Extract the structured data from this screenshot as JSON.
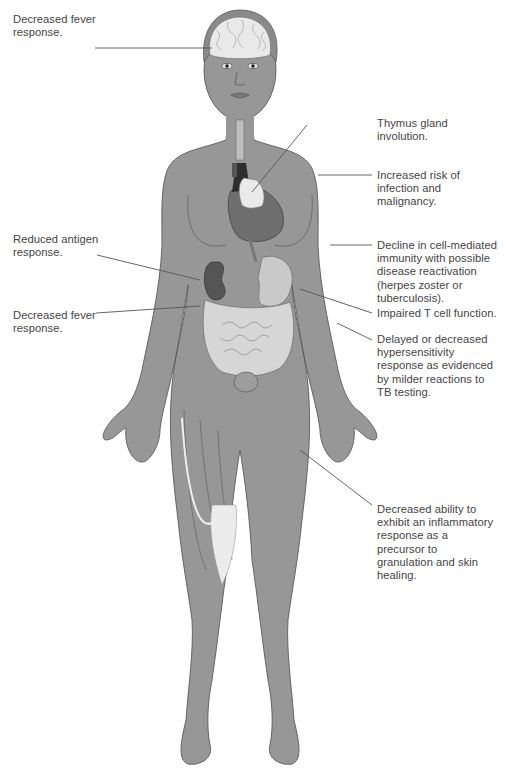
{
  "figure": {
    "colors": {
      "skin": "#979797",
      "outline": "#5a5a5a",
      "brain": "#e9e9e9",
      "hair": "#8a8a8a",
      "heart": "#6e6e6e",
      "kidney": "#555555",
      "organs_light": "#c9c9c9",
      "intestines": "#d6d6d6",
      "tendon": "#ececec",
      "muscle": "#8c8c8c",
      "leader_line": "#555555",
      "text": "#444444"
    }
  },
  "labels": {
    "left": [
      {
        "id": "decreased-fever-head",
        "text": "Decreased fever\nresponse."
      },
      {
        "id": "reduced-antigen",
        "text": "Reduced antigen\nresponse."
      },
      {
        "id": "decreased-fever-abdomen",
        "text": "Decreased fever\nresponse."
      }
    ],
    "right": [
      {
        "id": "thymus",
        "text": "Thymus gland\ninvolution."
      },
      {
        "id": "infection-risk",
        "text": "Increased risk of\ninfection and\nmalignancy."
      },
      {
        "id": "cell-mediated",
        "text": "Decline in cell-mediated\nimmunity with possible\ndisease reactivation\n(herpes zoster or\ntuberculosis)."
      },
      {
        "id": "t-cell",
        "text": "Impaired T cell function."
      },
      {
        "id": "hypersensitivity",
        "text": "Delayed or decreased\nhypersensitivity\nresponse as evidenced\nby milder reactions to\nTB testing."
      },
      {
        "id": "inflammatory",
        "text": "Decreased ability to\nexhibit an inflammatory\nresponse as a\nprecursor to\ngranulation and skin\nhealing."
      }
    ]
  }
}
